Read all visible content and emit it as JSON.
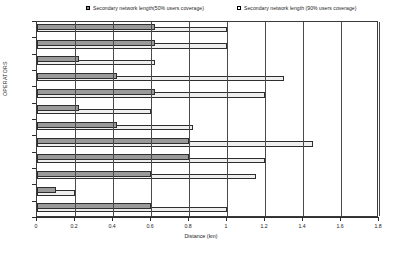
{
  "chart_data": {
    "type": "bar",
    "orientation": "horizontal",
    "title": "",
    "xlabel": "Distance (km)",
    "ylabel": "OPERATORS",
    "xlim": [
      0,
      1.8
    ],
    "xticks": [
      "0",
      "0.2",
      "0.4",
      "0.6",
      "0.8",
      "1",
      "1.2",
      "1.4",
      "1.6",
      "1.8"
    ],
    "xtick_values": [
      0,
      0.2,
      0.4,
      0.6,
      0.8,
      1.0,
      1.2,
      1.4,
      1.6,
      1.8
    ],
    "grid": true,
    "legend_position": "top",
    "categories": [
      "1",
      "2",
      "3",
      "4",
      "5",
      "6",
      "7",
      "8",
      "9",
      "10",
      "11",
      "12"
    ],
    "series": [
      {
        "name": "Secondary network length(50% users coverage)",
        "color": "#9a9a9a",
        "values": [
          0.62,
          0.62,
          0.22,
          0.42,
          0.62,
          0.22,
          0.42,
          0.8,
          0.8,
          0.6,
          0.1,
          0.6
        ]
      },
      {
        "name": "Secondary network length (90% users coverage)",
        "color": "#efefef",
        "values": [
          1.0,
          1.0,
          0.62,
          1.3,
          1.2,
          0.6,
          0.82,
          1.45,
          1.2,
          1.15,
          0.2,
          1.0
        ]
      }
    ]
  },
  "legend": {
    "items": [
      {
        "label": "Secondary network length(50% users coverage)",
        "swatch": "dark"
      },
      {
        "label": "Secondary network length (90% users coverage)",
        "swatch": "light"
      }
    ]
  },
  "axes": {
    "x_title": "Distance (km)",
    "y_title": "OPERATORS"
  }
}
